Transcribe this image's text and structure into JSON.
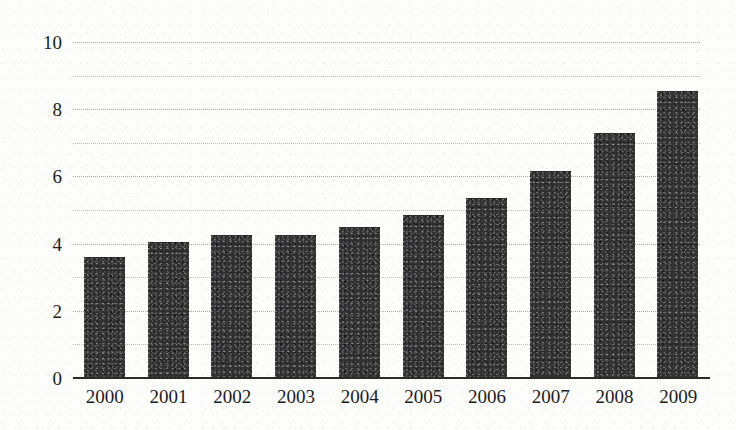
{
  "chart_data": {
    "type": "bar",
    "title": "",
    "subtitle": "",
    "xlabel": "",
    "ylabel": "",
    "categories": [
      "2000",
      "2001",
      "2002",
      "2003",
      "2004",
      "2005",
      "2006",
      "2007",
      "2008",
      "2009"
    ],
    "values": [
      3.6,
      4.05,
      4.25,
      4.25,
      4.5,
      4.85,
      5.35,
      6.15,
      7.3,
      8.55
    ],
    "series": [
      {
        "name": "",
        "values": [
          3.6,
          4.05,
          4.25,
          4.25,
          4.5,
          4.85,
          5.35,
          6.15,
          7.3,
          8.55
        ]
      }
    ],
    "ylim": [
      0,
      10
    ],
    "xlim_categories": 10,
    "y_tick_labels": [
      "0",
      "2",
      "4",
      "6",
      "8",
      "10"
    ],
    "y_tick_values": [
      0,
      2,
      4,
      6,
      8,
      10
    ],
    "y_gridline_values": [
      1,
      2,
      3,
      4,
      5,
      6,
      7,
      8,
      9,
      10
    ],
    "grid": true,
    "grid_style": "dotted",
    "grid_axis": "y",
    "legend": false,
    "legend_position": "none",
    "annotations": [],
    "data_labels": false,
    "bar_color": "#2f2f2f",
    "grid_color": "#b9b9b4",
    "axis_color": "#2b2b2b",
    "background_color": "#fdfdfc",
    "text_color": "#1c1c1c"
  }
}
